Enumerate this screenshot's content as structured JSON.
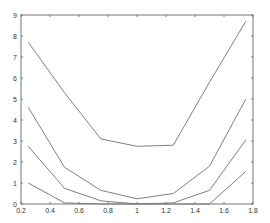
{
  "chart_data": {
    "type": "line",
    "title": "",
    "xlabel": "",
    "ylabel": "",
    "xlim": [
      0.2,
      1.8
    ],
    "ylim": [
      0,
      9
    ],
    "grid": false,
    "legend": null,
    "x": [
      0.25,
      0.5,
      0.75,
      1.0,
      1.25,
      1.5,
      1.75
    ],
    "x_ticks": [
      "0.2",
      "0.4",
      "0.6",
      "0.8",
      "1",
      "1.2",
      "1.4",
      "1.6",
      "1.8"
    ],
    "y_ticks": [
      "0",
      "1",
      "2",
      "3",
      "4",
      "5",
      "6",
      "7",
      "8",
      "9"
    ],
    "series": [
      {
        "name": "series-1",
        "values": [
          7.7,
          5.3,
          3.1,
          2.75,
          2.8,
          5.8,
          8.7
        ]
      },
      {
        "name": "series-2",
        "values": [
          4.6,
          1.75,
          0.65,
          0.25,
          0.5,
          1.8,
          5.0
        ]
      },
      {
        "name": "series-3",
        "values": [
          2.75,
          0.75,
          0.15,
          0.0,
          0.05,
          0.65,
          3.05
        ]
      },
      {
        "name": "series-4",
        "values": [
          1.0,
          0.05,
          0.0,
          0.0,
          0.0,
          0.0,
          1.55
        ]
      }
    ],
    "line_color": "#7f7f7f",
    "axis_color": "#777777"
  }
}
